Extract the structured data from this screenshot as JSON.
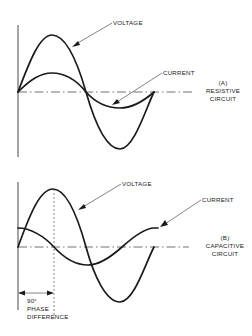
{
  "figure": {
    "panels": [
      {
        "id": "A",
        "caption_id": "(A)",
        "caption_lines": [
          "RESISTIVE",
          "CIRCUIT"
        ],
        "voltage_label": "VOLTAGE",
        "current_label": "CURRENT"
      },
      {
        "id": "B",
        "caption_id": "(B)",
        "caption_lines": [
          "CAPACITIVE",
          "CIRCUIT"
        ],
        "voltage_label": "VOLTAGE",
        "current_label": "CURRENT",
        "phase_annotation": [
          "90°",
          "PHASE",
          "DIFFERENCE"
        ]
      }
    ],
    "colors": {
      "ink": "#1a1a1a",
      "background": "#ffffff"
    }
  }
}
